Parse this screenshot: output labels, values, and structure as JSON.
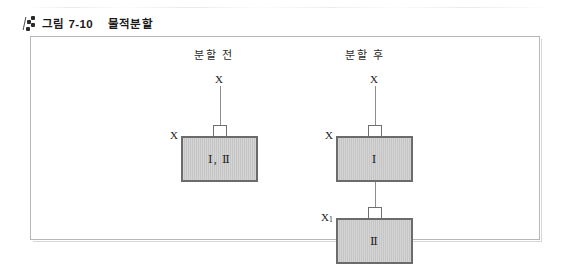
{
  "caption": {
    "icon": "beaded-diagonal-icon",
    "figure_number": "그림 7-10",
    "title": "물적분할"
  },
  "figure": {
    "columns": [
      {
        "heading": "분할 전"
      },
      {
        "heading": "분할 후"
      }
    ],
    "before": {
      "top_owner": "X",
      "side_owner": "X",
      "box_label": "Ⅰ, Ⅱ"
    },
    "after": {
      "top_owner": "X",
      "parent": {
        "side_owner": "X",
        "box_label": "Ⅰ"
      },
      "subsidiary": {
        "side_owner_base": "X",
        "side_owner_sub": "1",
        "box_label": "Ⅱ"
      }
    }
  },
  "colors": {
    "box_fill": "#c9c9c9",
    "box_border": "#6b6b6b",
    "frame_border": "#b7b7b7",
    "line": "#8d8d8d",
    "text": "#1a1a1a",
    "page_background": "#ffffff"
  }
}
